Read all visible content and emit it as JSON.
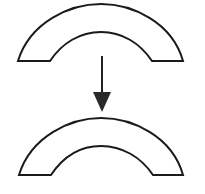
{
  "diagram": {
    "shapes": [
      {
        "name": "top-arch",
        "type": "half-annulus",
        "outer_left": [
          18,
          61
        ],
        "inner_left": [
          50,
          61
        ],
        "inner_right": [
          152,
          61
        ],
        "outer_right": [
          183,
          61
        ],
        "outer_top_y": 4,
        "inner_top_y": 32
      },
      {
        "name": "bottom-arch",
        "type": "half-annulus",
        "outer_left": [
          19,
          175
        ],
        "inner_left": [
          51,
          175
        ],
        "inner_right": [
          153,
          175
        ],
        "outer_right": [
          183,
          175
        ],
        "outer_top_y": 118,
        "inner_top_y": 146
      }
    ],
    "arrow": {
      "direction": "down",
      "x": 102,
      "y_start": 56,
      "head_top_y": 92,
      "tip_y": 112,
      "head_left_x": 93,
      "head_right_x": 111
    },
    "colors": {
      "stroke": "#1a1a1a",
      "fill": "#ffffff",
      "background": "#ffffff"
    }
  }
}
